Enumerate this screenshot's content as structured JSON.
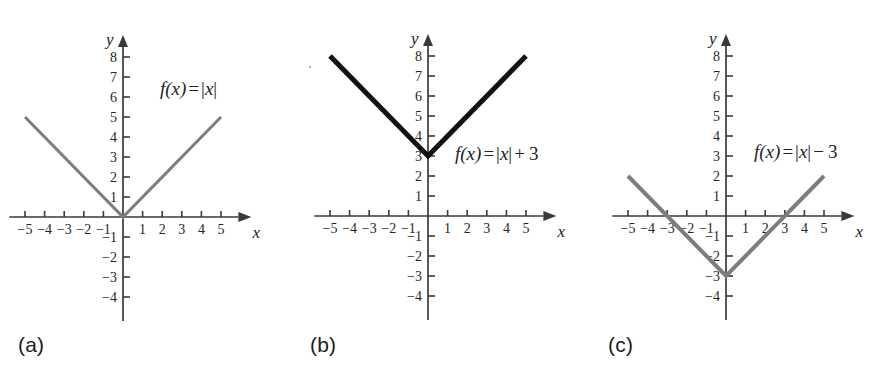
{
  "figure": {
    "width": 879,
    "height": 379,
    "background": "#ffffff"
  },
  "chart_data": [
    {
      "id": "a",
      "type": "line",
      "title": "",
      "equation_text": "f(x) = |x|",
      "equation_parts": {
        "fname": "f",
        "arg": "(x)",
        "eq": "=",
        "bars": "|x|",
        "op": "",
        "const": ""
      },
      "caption": "(a)",
      "function": "abs(x)",
      "shift": 0,
      "series": [
        {
          "name": "f(x) = |x|",
          "color": "#7d7d7d",
          "width": 3,
          "x": [
            -5,
            0,
            5
          ],
          "values": [
            5,
            0,
            5
          ]
        }
      ],
      "xlabel": "x",
      "ylabel": "y",
      "xlim": [
        -5.8,
        6.5
      ],
      "ylim": [
        -5.2,
        9.0
      ],
      "xticks": [
        -5,
        -4,
        -3,
        -2,
        -1,
        1,
        2,
        3,
        4,
        5
      ],
      "xtick_labels": [
        "-5",
        "-4",
        "-3",
        "-2",
        "-1",
        "1",
        "2",
        "3",
        "4",
        "5"
      ],
      "yticks": [
        -4,
        -3,
        -2,
        -1,
        1,
        2,
        3,
        4,
        5,
        6,
        7,
        8
      ],
      "ytick_labels": [
        "-4",
        "-3",
        "-2",
        "-1",
        "1",
        "2",
        "3",
        "4",
        "5",
        "6",
        "7",
        "8"
      ],
      "grid": false,
      "legend": "none",
      "vertex": [
        0,
        0
      ],
      "x_intercepts": [
        0
      ],
      "y_intercept": 0,
      "equation_pos": {
        "x": 160,
        "y": 78
      }
    },
    {
      "id": "b",
      "type": "line",
      "title": "",
      "equation_text": "f(x) = |x| + 3",
      "equation_parts": {
        "fname": "f",
        "arg": "(x)",
        "eq": "=",
        "bars": "|x|",
        "op": "+",
        "const": "3"
      },
      "caption": "(b)",
      "function": "abs(x) + 3",
      "shift": 3,
      "series": [
        {
          "name": "f(x) = |x| + 3",
          "color": "#111111",
          "width": 5,
          "x": [
            -5,
            0,
            5
          ],
          "values": [
            8,
            3,
            8
          ]
        }
      ],
      "xlabel": "x",
      "ylabel": "y",
      "xlim": [
        -5.8,
        6.5
      ],
      "ylim": [
        -5.2,
        9.0
      ],
      "xticks": [
        -5,
        -4,
        -3,
        -2,
        -1,
        1,
        2,
        3,
        4,
        5
      ],
      "xtick_labels": [
        "-5",
        "-4",
        "-3",
        "-2",
        "-1",
        "1",
        "2",
        "3",
        "4",
        "5"
      ],
      "yticks": [
        -4,
        -3,
        -2,
        -1,
        1,
        2,
        3,
        4,
        5,
        6,
        7,
        8
      ],
      "ytick_labels": [
        "-4",
        "-3",
        "-2",
        "-1",
        "1",
        "2",
        "3",
        "4",
        "5",
        "6",
        "7",
        "8"
      ],
      "grid": false,
      "legend": "none",
      "vertex": [
        0,
        3
      ],
      "x_intercepts": [],
      "y_intercept": 3,
      "equation_pos": {
        "x": 165,
        "y": 143
      }
    },
    {
      "id": "c",
      "type": "line",
      "title": "",
      "equation_text": "f(x) = |x| - 3",
      "equation_parts": {
        "fname": "f",
        "arg": "(x)",
        "eq": "=",
        "bars": "|x|",
        "op": "−",
        "const": "3"
      },
      "caption": "(c)",
      "function": "abs(x) - 3",
      "shift": -3,
      "series": [
        {
          "name": "f(x) = |x| - 3",
          "color": "#7d7d7d",
          "width": 4,
          "x": [
            -5,
            0,
            5
          ],
          "values": [
            2,
            -3,
            2
          ]
        }
      ],
      "xlabel": "x",
      "ylabel": "y",
      "xlim": [
        -5.8,
        6.5
      ],
      "ylim": [
        -5.2,
        9.0
      ],
      "xticks": [
        -5,
        -4,
        -3,
        -2,
        -1,
        1,
        2,
        3,
        4,
        5
      ],
      "xtick_labels": [
        "-5",
        "-4",
        "-3",
        "-2",
        "-1",
        "1",
        "2",
        "3",
        "4",
        "5"
      ],
      "yticks": [
        -4,
        -3,
        -2,
        -1,
        1,
        2,
        3,
        4,
        5,
        6,
        7,
        8
      ],
      "ytick_labels": [
        "-4",
        "-3",
        "-2",
        "-1",
        "1",
        "2",
        "3",
        "4",
        "5",
        "6",
        "7",
        "8"
      ],
      "grid": false,
      "legend": "none",
      "vertex": [
        0,
        -3
      ],
      "x_intercepts": [
        -3,
        3
      ],
      "y_intercept": -3,
      "equation_pos": {
        "x": 168,
        "y": 141
      }
    }
  ],
  "panels": [
    {
      "left": 0,
      "origin_x": 123,
      "origin_y": 217,
      "caption_x": 18,
      "caption_y": 333
    },
    {
      "left": 290,
      "origin_x": 138,
      "origin_y": 216,
      "caption_x": 20,
      "caption_y": 333
    },
    {
      "left": 586,
      "origin_x": 140,
      "origin_y": 216,
      "caption_x": 22,
      "caption_y": 333
    }
  ],
  "style": {
    "axis_color": "#3a3a3a",
    "tick_text_color": "#262626",
    "caption_color": "#1c1c1c",
    "unit_px": 19.6,
    "unit_py": 20.0
  }
}
